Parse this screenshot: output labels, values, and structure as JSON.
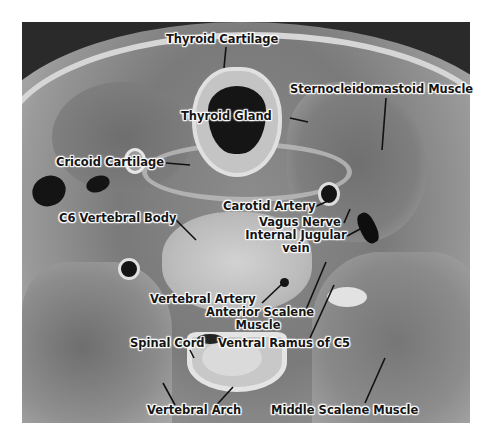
{
  "image": {
    "description": "Axial cross-section of the neck at the C6 level with anatomical labels",
    "labels": {
      "thyroid_cartilage": "Thyroid Cartilage",
      "sternocleidomastoid": "Sternocleidomastoid Muscle",
      "thyroid_gland": "Thyroid Gland",
      "cricoid_cartilage": "Cricoid Cartilage",
      "carotid_artery": "Carotid Artery",
      "c6_vertebral_body": "C6 Vertebral Body",
      "vagus_nerve": "Vagus Nerve",
      "internal_jugular_line1": "Internal Jugular",
      "internal_jugular_line2": "vein",
      "vertebral_artery": "Vertebral Artery",
      "anterior_scalene_line1": "Anterior Scalene",
      "anterior_scalene_line2": "Muscle",
      "spinal_cord": "Spinal Cord",
      "ventral_ramus": "Ventral Ramus of C5",
      "vertebral_arch": "Vertebral Arch",
      "middle_scalene": "Middle Scalene Muscle"
    }
  }
}
